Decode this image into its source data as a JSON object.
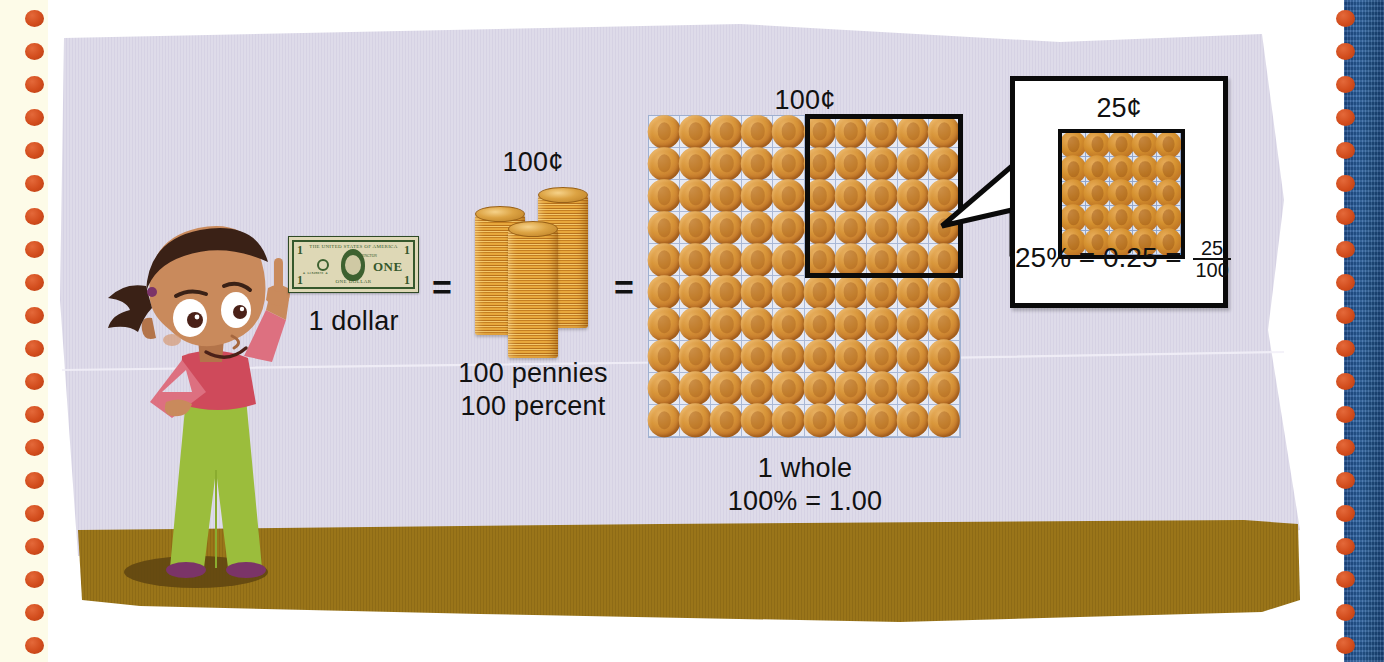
{
  "page": {
    "kind": "math-textbook-illustration",
    "topic": "Percent, decimal and fraction equivalence using money"
  },
  "colors": {
    "panel_bg": "#dedbe9",
    "ground": "#9a7519",
    "margin_bg": "#fdfbe8",
    "dot": "#d24c1c",
    "binder_blue": "#2c65a8",
    "ink": "#111111",
    "penny": "#d0892c",
    "grid_line": "#a9b8d6",
    "bill_green": "#35582c",
    "shirt": "#cf5566",
    "pants": "#9bbd3c",
    "skin": "#c98a5c",
    "hair": "#3a2116"
  },
  "decor": {
    "left_margin_name": "perforated-page-margin",
    "right_strip_name": "binder-edge",
    "dot_icon": "punch-hole-dot",
    "dot_count": 20
  },
  "scene": {
    "character": {
      "name": "cartoon-boy-pointing",
      "description": "Boy with bandana, red shirt, green pants, index finger raised"
    },
    "ground_label": "ground-band"
  },
  "equation": {
    "step1": {
      "icon": "dollar-bill",
      "caption": "1 dollar",
      "bill_text": {
        "country": "THE UNITED STATES OF AMERICA",
        "subtitle": "WASHINGTON",
        "denomination": "ONE",
        "bottom": "ONE DOLLAR",
        "corner": "1",
        "serial": "A 12345678 A"
      }
    },
    "operator1": "=",
    "step2": {
      "icon": "penny-stacks",
      "top_label": "100¢",
      "caption_line1": "100 pennies",
      "caption_line2": "100 percent",
      "stack_count": 3
    },
    "operator2": "=",
    "step3": {
      "icon": "hundred-penny-grid",
      "top_label": "100¢",
      "caption_line1": "1 whole",
      "caption_line2": "100% = 1.00",
      "rows": 10,
      "cols": 10,
      "total_pennies": 100,
      "highlight": {
        "name": "quarter-highlight-rectangle",
        "rows": 5,
        "cols": 5,
        "position": "top-right",
        "pennies": 25
      }
    }
  },
  "callout": {
    "name": "quarter-detail-callout",
    "title": "25¢",
    "grid": {
      "rows": 5,
      "cols": 5,
      "pennies": 25
    },
    "equation": {
      "percent": "25%",
      "eq1": "=",
      "decimal": "0.25",
      "eq2": "=",
      "fraction_numerator": "25",
      "fraction_denominator": "100"
    }
  },
  "chart_data": {
    "type": "table",
    "categories": [
      "1 dollar",
      "100 pennies",
      "1 whole",
      "25¢ part"
    ],
    "values": [
      1.0,
      1.0,
      1.0,
      0.25
    ],
    "annotations": [
      "1 dollar = 100¢ = 100 pennies = 100 percent",
      "1 whole  100% = 1.00",
      "25% = 0.25 = 25/100"
    ]
  }
}
